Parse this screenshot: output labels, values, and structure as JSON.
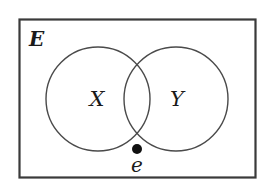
{
  "diagram": {
    "type": "venn",
    "universe": {
      "label": "E"
    },
    "sets": [
      {
        "label": "X"
      },
      {
        "label": "Y"
      }
    ],
    "element": {
      "label": "e",
      "region": "outside X and Y, inside E"
    },
    "colors": {
      "stroke": "#4a4a4a",
      "border": "#3a3a3a",
      "text": "#1a1a1a",
      "dot": "#111111",
      "background": "#ffffff"
    }
  }
}
